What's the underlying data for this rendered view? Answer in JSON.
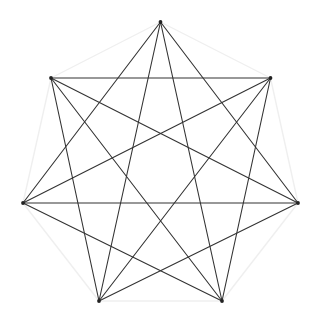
{
  "figure": {
    "type": "geometric-line-drawing",
    "shape_name": "heptagram",
    "background_color": "#ffffff",
    "canvas": {
      "width": 320,
      "height": 324
    }
  },
  "chart_data": {
    "type": "scatter",
    "xlabel": "",
    "ylabel": "",
    "grid": false,
    "legend": null,
    "xlim": [
      0,
      320
    ],
    "ylim": [
      324,
      0
    ],
    "geometry": {
      "vertex_count": 7,
      "center_x": 160.5,
      "center_y": 164.5,
      "radius": 142.5,
      "start_angle_deg": -90,
      "step_angle_deg": 51.4285714
    },
    "vertices": [
      {
        "id": "v0",
        "label": "top",
        "x": 160.5,
        "y": 22.0
      },
      {
        "id": "v1",
        "label": "upper-right",
        "x": 271.9,
        "y": 111.1
      },
      {
        "id": "v2",
        "label": "right-middle",
        "x": 299.2,
        "y": 250.4
      },
      {
        "id": "v3",
        "label": "lower-right",
        "x": 221.4,
        "y": 301.1
      },
      {
        "id": "v4",
        "label": "lower-left",
        "x": 99.6,
        "y": 301.1
      },
      {
        "id": "v5",
        "label": "left-middle",
        "x": 21.8,
        "y": 250.4
      },
      {
        "id": "v6",
        "label": "upper-left",
        "x": 49.1,
        "y": 111.1
      }
    ],
    "vertices_render": [
      {
        "id": "p0",
        "label": "top",
        "x": 160.5,
        "y": 22.0
      },
      {
        "id": "p1",
        "label": "upper-right",
        "x": 270.5,
        "y": 78.0
      },
      {
        "id": "p2",
        "label": "right-middle",
        "x": 298.0,
        "y": 203.0
      },
      {
        "id": "p3",
        "label": "lower-right",
        "x": 222.0,
        "y": 301.0
      },
      {
        "id": "p4",
        "label": "lower-left",
        "x": 99.0,
        "y": 301.0
      },
      {
        "id": "p5",
        "label": "left-middle",
        "x": 23.0,
        "y": 203.0
      },
      {
        "id": "p6",
        "label": "upper-left",
        "x": 51.0,
        "y": 78.0
      }
    ],
    "perimeter_edges": [
      [
        0,
        1
      ],
      [
        1,
        2
      ],
      [
        2,
        3
      ],
      [
        3,
        4
      ],
      [
        4,
        5
      ],
      [
        5,
        6
      ],
      [
        6,
        0
      ]
    ],
    "star_edges_step2": [
      [
        0,
        2
      ],
      [
        2,
        4
      ],
      [
        4,
        6
      ],
      [
        6,
        1
      ],
      [
        1,
        3
      ],
      [
        3,
        5
      ],
      [
        5,
        0
      ]
    ],
    "star_edges_step3": [
      [
        0,
        3
      ],
      [
        3,
        6
      ],
      [
        6,
        2
      ],
      [
        2,
        5
      ],
      [
        5,
        1
      ],
      [
        1,
        4
      ],
      [
        4,
        0
      ]
    ],
    "values": [
      22.0,
      78.0,
      203.0,
      301.0,
      301.0,
      203.0,
      78.0
    ],
    "categories": [
      "top",
      "upper-right",
      "right-middle",
      "lower-right",
      "lower-left",
      "left-middle",
      "upper-left"
    ]
  },
  "style": {
    "chord_color": "#333333",
    "chord_width": 1.1,
    "perimeter_color": "#efefef",
    "perimeter_width": 1.4,
    "vertex_color": "#222222",
    "vertex_radius": 1.9
  }
}
